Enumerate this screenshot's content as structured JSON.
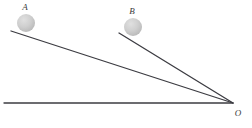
{
  "diagram": {
    "canvas": {
      "width": 252,
      "height": 128,
      "background": "#ffffff"
    },
    "colors": {
      "line": "#3c3c42",
      "ball_fill_light": "#d8d8d8",
      "ball_fill_dark": "#bdbdbd",
      "label": "#3a3a3a"
    },
    "balls": [
      {
        "id": "A",
        "label": "A",
        "cx": 26,
        "cy": 23,
        "r": 9,
        "label_x": 25,
        "label_y": 10
      },
      {
        "id": "B",
        "label": "B",
        "cx": 133,
        "cy": 27,
        "r": 9,
        "label_x": 132,
        "label_y": 14
      }
    ],
    "lines": [
      {
        "id": "incline-a",
        "name": "incline-from-a-to-o",
        "x1": 11,
        "y1": 31,
        "x2": 233,
        "y2": 103,
        "width": 1.3
      },
      {
        "id": "incline-b",
        "name": "incline-from-b-to-o",
        "x1": 119,
        "y1": 33,
        "x2": 233,
        "y2": 103,
        "width": 1.3
      },
      {
        "id": "baseline",
        "name": "horizontal-baseline-to-o",
        "x1": 4,
        "y1": 103,
        "x2": 233,
        "y2": 103,
        "width": 1.3
      }
    ],
    "vertex": {
      "id": "O",
      "label": "O",
      "x": 233,
      "y": 103,
      "label_x": 238,
      "label_y": 116
    }
  }
}
